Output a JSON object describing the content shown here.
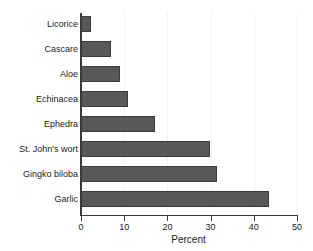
{
  "chart_data": {
    "type": "bar",
    "orientation": "horizontal",
    "title": "",
    "subtitle": "",
    "xlabel": "Percent",
    "ylabel": "",
    "xlim": [
      0,
      50
    ],
    "xticks": [
      0,
      10,
      20,
      30,
      40,
      50
    ],
    "xtick_labels": [
      "0",
      "10",
      "20",
      "30",
      "40",
      "50"
    ],
    "grid": true,
    "grid_axis": "x",
    "legend": false,
    "legend_position": "none",
    "categories": [
      "Licorice",
      "Cascare",
      "Aloe",
      "Echinacea",
      "Ephedra",
      "St. John's wort",
      "Gingko biloba",
      "Garlic"
    ],
    "values": [
      2.2,
      7.0,
      9.0,
      10.8,
      17.2,
      29.9,
      31.5,
      43.5
    ],
    "bar_color": "#585858",
    "bar_edge_color": "#3d3d3d",
    "axis_color": "#3a3a3a",
    "grid_color": "#f2f2f2",
    "background_color": "#ffffff"
  }
}
